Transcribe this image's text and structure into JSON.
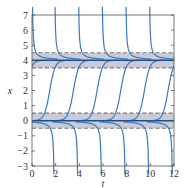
{
  "chart_data": {
    "type": "line",
    "title": "",
    "xlabel": "t",
    "ylabel": "x",
    "xlim": [
      0,
      12
    ],
    "ylim": [
      -3,
      7
    ],
    "x_ticks": [
      0,
      2,
      4,
      6,
      8,
      10,
      12
    ],
    "x_tick_labels": [
      "0",
      "2",
      "4",
      "6",
      "8",
      "10",
      "12"
    ],
    "y_ticks": [
      -3,
      -2,
      -1,
      0,
      1,
      2,
      3,
      4,
      5,
      6,
      7
    ],
    "y_tick_labels": [
      "-3",
      "-2",
      "-1",
      "0",
      "1",
      "2",
      "3",
      "4",
      "5",
      "6",
      "7"
    ],
    "grid": false,
    "legend": null,
    "equilibria": [
      {
        "x": 4,
        "band": [
          3.5,
          4.5
        ],
        "description": "solid line with shaded band, dashed boundaries"
      },
      {
        "x": 0,
        "band": [
          -0.5,
          0.5
        ],
        "description": "solid line with shaded band, dashed boundaries"
      }
    ],
    "series": [
      {
        "name": "descending from top toward x=4",
        "asymptote_t": [
          0.0,
          1.9,
          3.9,
          5.9,
          7.9,
          9.9
        ]
      },
      {
        "name": "rising S-curves from x=0 to x=4",
        "center_t": [
          -0.5,
          1.5,
          3.5,
          5.5,
          7.5,
          9.5,
          11.5
        ]
      },
      {
        "name": "descending from x=0 to bottom",
        "asymptote_t": [
          1.9,
          3.9,
          5.9,
          7.9,
          9.9,
          11.9
        ]
      }
    ],
    "colors": {
      "curve": "#3a78c2",
      "equilibrium": "#1f4e8a",
      "band": "#c9ccd6",
      "dash": "#7a7a7a",
      "frame": "#555555"
    }
  },
  "plot_area": {
    "left": 32,
    "top": 15,
    "right": 174,
    "bottom": 166
  }
}
